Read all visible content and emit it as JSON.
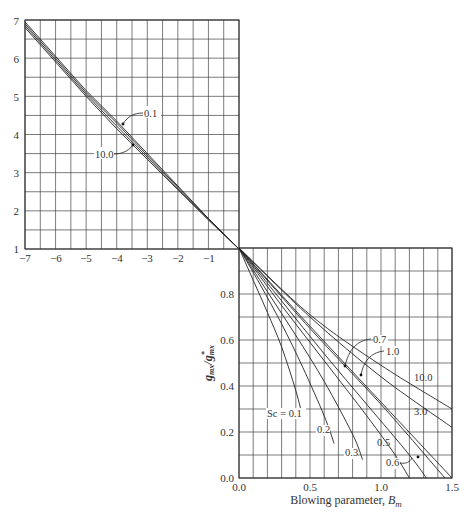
{
  "chart_data": [
    {
      "panel": "upper-left",
      "type": "line",
      "title": "",
      "xlabel": "",
      "ylabel": "",
      "xlim": [
        -7,
        0
      ],
      "ylim": [
        1,
        7
      ],
      "xticks": [
        "−7",
        "−6",
        "−5",
        "−4",
        "−3",
        "−2",
        "−1"
      ],
      "yticks": [
        "1",
        "2",
        "3",
        "4",
        "5",
        "6",
        "7"
      ],
      "grid": true,
      "annotations": [
        "0.1",
        "10.0"
      ],
      "series": [
        {
          "name": "Sc = 0.1",
          "x": [
            -7,
            -6,
            -5,
            -4,
            -3,
            -2,
            -1,
            0
          ],
          "y": [
            6.95,
            6.05,
            5.15,
            4.35,
            3.5,
            2.65,
            1.8,
            1.0
          ]
        },
        {
          "name": "Sc = 0.3",
          "x": [
            -7,
            -6,
            -5,
            -4,
            -3,
            -2,
            -1,
            0
          ],
          "y": [
            6.9,
            6.0,
            5.1,
            4.3,
            3.45,
            2.62,
            1.8,
            1.0
          ]
        },
        {
          "name": "Sc = 1.0",
          "x": [
            -7,
            -6,
            -5,
            -4,
            -3,
            -2,
            -1,
            0
          ],
          "y": [
            6.85,
            5.95,
            5.05,
            4.22,
            3.4,
            2.58,
            1.78,
            1.0
          ]
        },
        {
          "name": "Sc = 10.0",
          "x": [
            -7,
            -6,
            -5,
            -4,
            -3,
            -2,
            -1,
            0
          ],
          "y": [
            6.8,
            5.9,
            5.0,
            4.15,
            3.35,
            2.55,
            1.76,
            1.0
          ]
        }
      ]
    },
    {
      "panel": "lower-right",
      "type": "line",
      "title": "",
      "xlabel": "Blowing parameter, B_m",
      "ylabel": "g_mx / g*_mx",
      "xlim": [
        0,
        1.5
      ],
      "ylim": [
        0,
        1.0
      ],
      "xticks": [
        "0.0",
        "0.5",
        "1.0",
        "1.5"
      ],
      "yticks": [
        "0.0",
        "0.2",
        "0.4",
        "0.6",
        "0.8"
      ],
      "grid": true,
      "series": [
        {
          "name": "Sc = 0.1",
          "x": [
            0,
            0.1,
            0.2,
            0.3,
            0.4,
            0.45
          ],
          "y": [
            1.0,
            0.86,
            0.72,
            0.57,
            0.38,
            0.26
          ]
        },
        {
          "name": "0.2",
          "x": [
            0,
            0.15,
            0.3,
            0.45,
            0.6,
            0.67
          ],
          "y": [
            1.0,
            0.84,
            0.67,
            0.48,
            0.27,
            0.15
          ]
        },
        {
          "name": "0.3",
          "x": [
            0,
            0.2,
            0.4,
            0.6,
            0.8,
            0.87
          ],
          "y": [
            1.0,
            0.81,
            0.62,
            0.42,
            0.19,
            0.08
          ]
        },
        {
          "name": "0.5",
          "x": [
            0,
            0.3,
            0.6,
            0.9,
            1.1,
            1.2
          ],
          "y": [
            1.0,
            0.75,
            0.51,
            0.27,
            0.1,
            0.0
          ]
        },
        {
          "name": "0.6",
          "x": [
            0,
            0.3,
            0.6,
            0.9,
            1.2,
            1.32
          ],
          "y": [
            1.0,
            0.77,
            0.54,
            0.32,
            0.1,
            0.0
          ]
        },
        {
          "name": "0.7",
          "x": [
            0,
            0.5,
            1.0,
            1.45
          ],
          "y": [
            1.0,
            0.65,
            0.32,
            0.0
          ]
        },
        {
          "name": "1.0",
          "x": [
            0,
            0.5,
            1.0,
            1.5
          ],
          "y": [
            1.0,
            0.66,
            0.33,
            0.0
          ]
        },
        {
          "name": "3.0",
          "x": [
            0,
            0.5,
            1.0,
            1.5
          ],
          "y": [
            1.0,
            0.7,
            0.44,
            0.22
          ]
        },
        {
          "name": "10.0",
          "x": [
            0,
            0.5,
            1.0,
            1.5
          ],
          "y": [
            1.0,
            0.71,
            0.49,
            0.3
          ]
        }
      ]
    }
  ],
  "labels": {
    "upper_01": "0.1",
    "upper_10": "10.0",
    "sc01": "Sc = 0.1",
    "sc02": "0.2",
    "sc03": "0.3",
    "sc05": "0.5",
    "sc06": "0.6",
    "sc07": "0.7",
    "sc10": "1.0",
    "sc30": "3.0",
    "sc100": "10.0",
    "xlabel_main": "Blowing parameter, ",
    "xlabel_sym": "B",
    "xlabel_sub": "m",
    "ylabel_num": "g",
    "ylabel_num_sub": "mx",
    "ylabel_den": "g",
    "ylabel_den_sup": "*",
    "ylabel_den_sub": "mx"
  },
  "ticks": {
    "upper_x": [
      "−7",
      "−6",
      "−5",
      "−4",
      "−3",
      "−2",
      "−1"
    ],
    "upper_y": [
      "1",
      "2",
      "3",
      "4",
      "5",
      "6",
      "7"
    ],
    "lower_x": [
      "0.0",
      "0.5",
      "1.0",
      "1.5"
    ],
    "lower_y": [
      "0.0",
      "0.2",
      "0.4",
      "0.6",
      "0.8"
    ]
  }
}
